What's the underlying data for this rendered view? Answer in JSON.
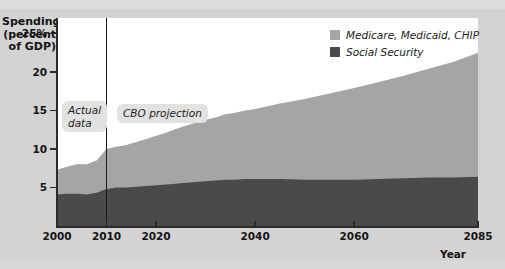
{
  "chart_data": {
    "type": "area",
    "stacked": true,
    "title": "",
    "ylabel": "Spending (percent of GDP)",
    "xlabel": "Year",
    "xlim": [
      2000,
      2085
    ],
    "ylim": [
      0,
      27
    ],
    "grid": false,
    "legend_position": "top-right",
    "y_ticks": [
      {
        "value": 25,
        "label": "25%"
      },
      {
        "value": 20,
        "label": "20"
      },
      {
        "value": 15,
        "label": "15"
      },
      {
        "value": 10,
        "label": "10"
      },
      {
        "value": 5,
        "label": "5"
      }
    ],
    "x_ticks": [
      {
        "value": 2000,
        "label": "2000"
      },
      {
        "value": 2010,
        "label": "2010"
      },
      {
        "value": 2020,
        "label": "2020"
      },
      {
        "value": 2040,
        "label": "2040"
      },
      {
        "value": 2060,
        "label": "2060"
      },
      {
        "value": 2085,
        "label": "2085"
      }
    ],
    "x": [
      2000,
      2002,
      2004,
      2006,
      2008,
      2010,
      2012,
      2014,
      2016,
      2018,
      2020,
      2022,
      2024,
      2026,
      2028,
      2030,
      2032,
      2034,
      2036,
      2038,
      2040,
      2045,
      2050,
      2055,
      2060,
      2065,
      2070,
      2075,
      2080,
      2085
    ],
    "series": [
      {
        "name": "Social Security",
        "color": "#4a4a4a",
        "values": [
          4.1,
          4.2,
          4.2,
          4.1,
          4.3,
          4.8,
          5.0,
          5.0,
          5.1,
          5.2,
          5.3,
          5.4,
          5.5,
          5.6,
          5.7,
          5.8,
          5.9,
          6.0,
          6.0,
          6.1,
          6.1,
          6.1,
          6.0,
          6.0,
          6.0,
          6.1,
          6.2,
          6.3,
          6.3,
          6.4
        ]
      },
      {
        "name": "Medicare, Medicaid, CHIP",
        "color": "#a5a5a5",
        "values": [
          3.2,
          3.5,
          3.8,
          3.9,
          4.2,
          5.2,
          5.3,
          5.5,
          5.8,
          6.1,
          6.4,
          6.7,
          7.1,
          7.4,
          7.7,
          8.0,
          8.2,
          8.5,
          8.7,
          8.9,
          9.1,
          9.8,
          10.5,
          11.2,
          11.9,
          12.6,
          13.3,
          14.1,
          15.0,
          16.1
        ]
      }
    ],
    "totals": [
      7.3,
      7.7,
      8.0,
      8.0,
      8.5,
      10.0,
      10.3,
      10.5,
      10.9,
      11.3,
      11.7,
      12.1,
      12.6,
      13.0,
      13.4,
      13.8,
      14.1,
      14.5,
      14.7,
      15.0,
      15.2,
      15.9,
      16.5,
      17.2,
      17.9,
      18.7,
      19.5,
      20.4,
      21.3,
      22.5
    ],
    "annotations": [
      {
        "id": "actual-data",
        "text": "Actual\ndata",
        "x_range": [
          2000,
          2010
        ]
      },
      {
        "id": "cbo-projection",
        "text": "CBO projection",
        "x_range": [
          2010,
          2085
        ]
      }
    ],
    "divider": {
      "value": 2010,
      "label": "actual-vs-projection"
    }
  },
  "axes": {
    "y_title": "Spending\n(percent\nof GDP)",
    "x_title": "Year"
  },
  "legend": {
    "entries": [
      {
        "label": "Medicare, Medicaid, CHIP",
        "color": "#a5a5a5"
      },
      {
        "label": "Social Security",
        "color": "#4a4a4a"
      }
    ]
  },
  "annotations": {
    "actual": "Actual\ndata",
    "projection": "CBO projection"
  },
  "colors": {
    "background": "#d3d3d3",
    "plot_background": "#ffffff",
    "axis": "#2b2b2b",
    "medicare": "#a5a5a5",
    "social_security": "#4a4a4a",
    "pill_background": "#e2e2e2"
  }
}
